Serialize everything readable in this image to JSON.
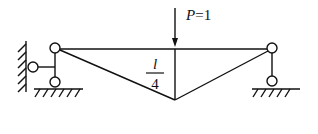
{
  "diagram": {
    "type": "influence line / truss structure diagram",
    "load": {
      "label": "P=1",
      "symbol": "P",
      "value": "1"
    },
    "ordinate": {
      "numerator": "l",
      "denominator": "4"
    },
    "supports": [
      {
        "name": "left",
        "kind": "pinned support with horizontal link to wall"
      },
      {
        "name": "right",
        "kind": "roller link support"
      }
    ],
    "colors": {
      "line": "#111111",
      "background": "#ffffff"
    }
  }
}
